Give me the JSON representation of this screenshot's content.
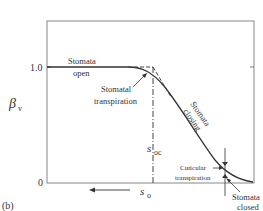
{
  "figure": {
    "panel_label": "(b)",
    "y_axis": {
      "symbol": "β",
      "subscript": "v",
      "ticks": [
        "1.0",
        "0"
      ]
    },
    "x_axis": {
      "symbol": "s",
      "subscript": "o",
      "direction_arrow": "left"
    },
    "marker": {
      "symbol": "s",
      "subscript": "oc"
    },
    "annotations": {
      "stomata_open_line1": "Stomata",
      "stomata_open_line2": "open",
      "stomatal_transpiration_line1": "Stomatal",
      "stomatal_transpiration_line2": "transpiration",
      "stomata_closing_line1": "Stomata",
      "stomata_closing_line2": "closing",
      "cuticular_line1": "Cuticular",
      "cuticular_line2": "transpiration",
      "stomata_closed_line1": "Stomata",
      "stomata_closed_line2": "closed"
    },
    "colors": {
      "line": "#333333",
      "frame": "#777777"
    }
  }
}
